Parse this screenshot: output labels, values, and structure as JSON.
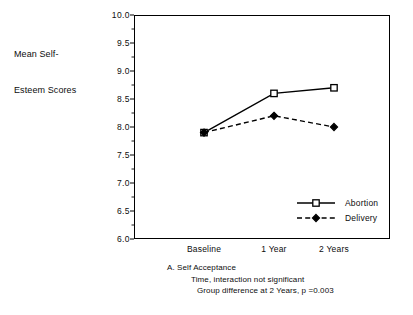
{
  "chart_data": {
    "type": "line",
    "title": "",
    "ylabel": "Mean Self-\nEsteem Scores",
    "ylabel_line1": "Mean Self-",
    "ylabel_line2": "Esteem Scores",
    "xlabel": "",
    "categories": [
      "Baseline",
      "1 Year",
      "2 Years"
    ],
    "series": [
      {
        "name": "Abortion",
        "values": [
          7.9,
          8.6,
          8.7
        ],
        "marker": "open-square",
        "linestyle": "solid",
        "color": "#000000"
      },
      {
        "name": "Delivery",
        "values": [
          7.9,
          8.2,
          8.0
        ],
        "marker": "filled-diamond",
        "linestyle": "dashed",
        "color": "#000000"
      }
    ],
    "ylim": [
      6.0,
      10.0
    ],
    "yticks": [
      10.0,
      9.5,
      9.0,
      8.5,
      8.0,
      7.5,
      7.0,
      6.5,
      6.0
    ],
    "ytick_labels": [
      "10.0",
      "9.5",
      "9.0",
      "8.5",
      "8.0",
      "7.5",
      "7.0",
      "6.5",
      "6.0"
    ],
    "yminor_step": 0.25,
    "grid": false,
    "legend_position": "lower right",
    "frame": true
  },
  "caption": {
    "line1": "A.   Self Acceptance",
    "line2": "Time, interaction not significant",
    "line3": "Group difference at 2 Years, p =0.003"
  }
}
